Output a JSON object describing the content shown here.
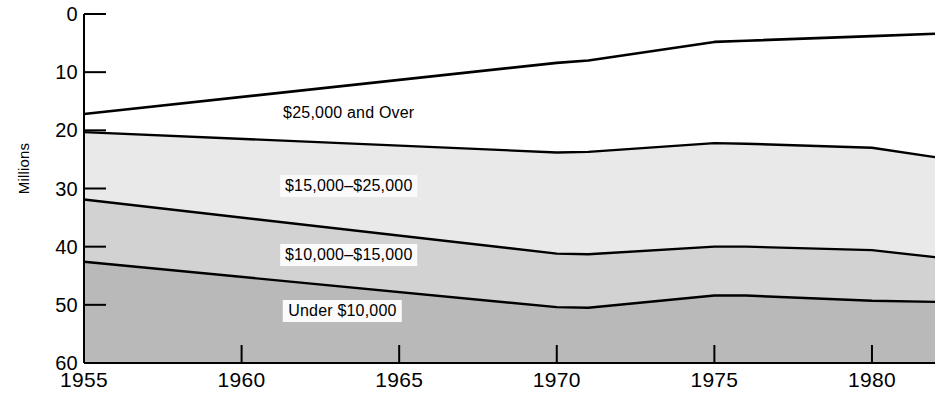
{
  "chart_data": {
    "type": "area",
    "title": "",
    "subtitle": "",
    "xlabel": "",
    "ylabel": "Millions",
    "stacked": true,
    "grid": false,
    "legend_position": "inline-labels",
    "xlim": [
      1955,
      1982
    ],
    "ylim": [
      0,
      60
    ],
    "x_ticks": [
      1955,
      1960,
      1965,
      1970,
      1975,
      1980
    ],
    "y_ticks": [
      0,
      10,
      20,
      30,
      40,
      50,
      60
    ],
    "x": [
      1955,
      1970,
      1971,
      1975,
      1976,
      1980,
      1982
    ],
    "series": [
      {
        "name": "Under $10,000",
        "fill": "#b9b9b9",
        "cumulative_values": [
          17.4,
          9.6,
          9.5,
          11.6,
          11.6,
          10.7,
          10.5
        ]
      },
      {
        "name": "$10,000-$15,000",
        "fill": "#d2d2d2",
        "cumulative_values": [
          28.1,
          18.8,
          18.7,
          20.0,
          20.0,
          19.4,
          18.2
        ]
      },
      {
        "name": "$15,000-$25,000",
        "fill": "#e9e9e9",
        "cumulative_values": [
          39.7,
          36.2,
          36.3,
          37.8,
          37.7,
          37.0,
          35.4
        ]
      },
      {
        "name": "$25,000 and Over",
        "fill": "#ffffff",
        "cumulative_values": [
          42.8,
          51.6,
          52.0,
          55.2,
          55.4,
          56.2,
          56.6
        ]
      }
    ],
    "band_labels": [
      {
        "text": "$25,000 and Over",
        "x": 1963.4,
        "y": 43.0,
        "boxed": false
      },
      {
        "text": "$15,000–$25,000",
        "x": 1963.4,
        "y": 30.5,
        "boxed": true
      },
      {
        "text": "$10,000–$15,000",
        "x": 1963.4,
        "y": 18.5,
        "boxed": true
      },
      {
        "text": "Under $10,000",
        "x": 1963.2,
        "y": 9.0,
        "boxed": true
      }
    ]
  },
  "axis": {
    "y_label": "Millions",
    "y_tick_labels": [
      "60",
      "50",
      "40",
      "30",
      "20",
      "10",
      "0"
    ],
    "x_tick_labels": [
      "1955",
      "1960",
      "1965",
      "1970",
      "1975",
      "1980"
    ]
  },
  "colors": {
    "axis": "#000000",
    "line": "#000000",
    "band_under_10k": "#b9b9b9",
    "band_10k_15k": "#d2d2d2",
    "band_15k_25k": "#e9e9e9",
    "band_25k_over": "#ffffff",
    "label_box": "#fbfbfb"
  }
}
